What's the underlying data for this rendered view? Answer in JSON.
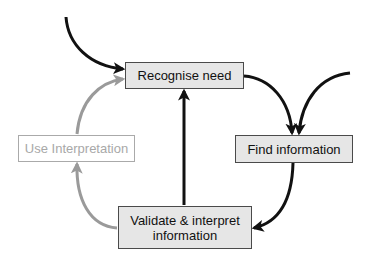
{
  "diagram": {
    "type": "cycle-flowchart",
    "colors": {
      "background": "#ffffff",
      "node_fill": "#e6e6e6",
      "node_border": "#4a4a4a",
      "faded_border": "#aaaaaa",
      "faded_text": "#a8a8a8",
      "arrow_dark": "#111111",
      "arrow_gray": "#999999"
    },
    "nodes": {
      "recognise": {
        "label": "Recognise need"
      },
      "find": {
        "label": "Find information"
      },
      "use": {
        "label": "Use Interpretation"
      },
      "validate": {
        "line1": "Validate & interpret",
        "line2": "information"
      }
    },
    "edges": [
      {
        "from": "external-top-left",
        "to": "recognise",
        "style": "dark"
      },
      {
        "from": "recognise",
        "to": "find",
        "style": "dark"
      },
      {
        "from": "external-top-right",
        "to": "find",
        "style": "dark"
      },
      {
        "from": "find",
        "to": "validate",
        "style": "dark"
      },
      {
        "from": "validate",
        "to": "recognise",
        "style": "dark"
      },
      {
        "from": "validate",
        "to": "use",
        "style": "gray"
      },
      {
        "from": "use",
        "to": "recognise",
        "style": "gray"
      }
    ]
  }
}
